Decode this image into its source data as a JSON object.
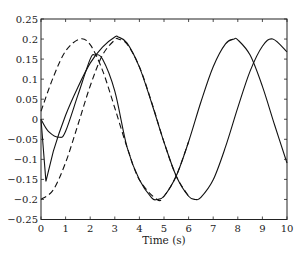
{
  "chart_data": {
    "type": "line",
    "title": "",
    "xlabel": "Time (s)",
    "ylabel": "",
    "xlim": [
      0,
      10
    ],
    "ylim": [
      -0.25,
      0.25
    ],
    "x_ticks": [
      "0",
      "1",
      "2",
      "3",
      "4",
      "5",
      "6",
      "7",
      "8",
      "9",
      "10"
    ],
    "y_ticks": [
      "0.25",
      "0.2",
      "0.15",
      "0.1",
      "0.05",
      "0",
      "-0.05",
      "-0.1",
      "-0.15",
      "-0.2",
      "-0.25"
    ],
    "grid": false,
    "legend": null,
    "series": [
      {
        "name": "solid-1",
        "style": "solid",
        "x": [
          0,
          0.2,
          0.5,
          1,
          1.5,
          2,
          2.5,
          3,
          3.14,
          3.5,
          4,
          4.5,
          5,
          5.5,
          6,
          6.28,
          6.5,
          7,
          7.5,
          8,
          8.5,
          9,
          9.42,
          10
        ],
        "values": [
          0,
          -0.155,
          -0.08,
          0.01,
          0.08,
          0.14,
          0.18,
          0.205,
          0.205,
          0.19,
          0.13,
          0.04,
          -0.057,
          -0.142,
          -0.192,
          -0.2,
          -0.195,
          -0.151,
          -0.069,
          0.029,
          0.12,
          0.182,
          0.2,
          0.168
        ]
      },
      {
        "name": "solid-2",
        "style": "solid",
        "x": [
          0,
          0.3,
          0.75,
          1,
          1.5,
          2,
          2.2,
          2.5,
          3,
          3.5,
          4,
          4.5,
          4.71,
          5,
          5.5,
          6,
          6.5,
          7,
          7.5,
          7.85,
          8,
          8.5,
          9,
          9.5,
          10
        ],
        "values": [
          0,
          -0.03,
          -0.045,
          -0.03,
          0.06,
          0.15,
          0.16,
          0.15,
          0.07,
          -0.07,
          -0.151,
          -0.196,
          -0.2,
          -0.192,
          -0.141,
          -0.056,
          0.043,
          0.131,
          0.188,
          0.2,
          0.198,
          0.16,
          0.082,
          -0.015,
          -0.109
        ]
      },
      {
        "name": "dashed-1",
        "style": "dashed",
        "x": [
          0,
          0.5,
          1,
          1.57,
          2,
          2.5,
          3,
          3.5,
          4,
          4.71,
          5,
          5.5,
          6
        ],
        "values": [
          0.02,
          0.105,
          0.17,
          0.2,
          0.186,
          0.122,
          0.028,
          -0.07,
          -0.151,
          -0.2,
          -0.192,
          -0.141,
          -0.056
        ]
      },
      {
        "name": "dashed-2",
        "style": "dashed",
        "x": [
          0,
          0.5,
          1,
          1.5,
          2,
          2.5,
          3,
          3.14,
          3.5,
          4,
          4.5,
          5,
          5.5,
          6
        ],
        "values": [
          -0.2,
          -0.176,
          -0.108,
          -0.014,
          0.083,
          0.16,
          0.198,
          0.2,
          0.187,
          0.131,
          0.042,
          -0.057,
          -0.142,
          -0.192
        ]
      }
    ]
  }
}
